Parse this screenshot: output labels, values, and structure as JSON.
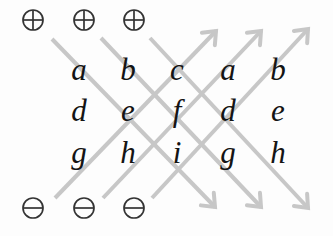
{
  "matrix": {
    "rows": [
      [
        "a",
        "b",
        "c",
        "a",
        "b"
      ],
      [
        "d",
        "e",
        "f",
        "d",
        "e"
      ],
      [
        "g",
        "h",
        "i",
        "g",
        "h"
      ]
    ]
  },
  "markers": {
    "top": [
      {
        "icon": "circled-plus",
        "symbol": "⊕"
      },
      {
        "icon": "circled-plus",
        "symbol": "⊕"
      },
      {
        "icon": "circled-plus",
        "symbol": "⊕"
      }
    ],
    "bottom": [
      {
        "icon": "circled-minus",
        "symbol": "⊖"
      },
      {
        "icon": "circled-minus",
        "symbol": "⊖"
      },
      {
        "icon": "circled-minus",
        "symbol": "⊖"
      }
    ]
  },
  "arrows": [
    {
      "direction": "down-right",
      "sign": "plus",
      "through": [
        "a",
        "e",
        "i"
      ]
    },
    {
      "direction": "down-right",
      "sign": "plus",
      "through": [
        "b",
        "f",
        "g"
      ]
    },
    {
      "direction": "down-right",
      "sign": "plus",
      "through": [
        "c",
        "d",
        "h"
      ]
    },
    {
      "direction": "up-right",
      "sign": "minus",
      "through": [
        "g",
        "e",
        "c"
      ]
    },
    {
      "direction": "up-right",
      "sign": "minus",
      "through": [
        "h",
        "f",
        "a"
      ]
    },
    {
      "direction": "up-right",
      "sign": "minus",
      "through": [
        "i",
        "d",
        "b"
      ]
    }
  ],
  "colors": {
    "arrow": "#c7c7c7",
    "symbol": "#333333",
    "letter": "#141414",
    "background": "#fdfdfd"
  }
}
